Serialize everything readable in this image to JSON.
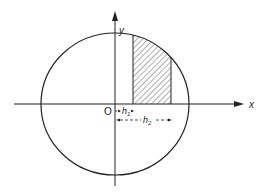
{
  "figure": {
    "axes": {
      "x_label": "x",
      "y_label": "y",
      "origin_label": "O"
    },
    "dimensions": {
      "h1_label": "h",
      "h1_sub": "1",
      "h2_label": "h",
      "h2_sub": "2"
    },
    "shape": "circle",
    "shaded_region": "vertical strip from x = h1 to x = h2, above x-axis inside circle",
    "colors": {
      "line": "#222222",
      "background": "#ffffff"
    }
  }
}
